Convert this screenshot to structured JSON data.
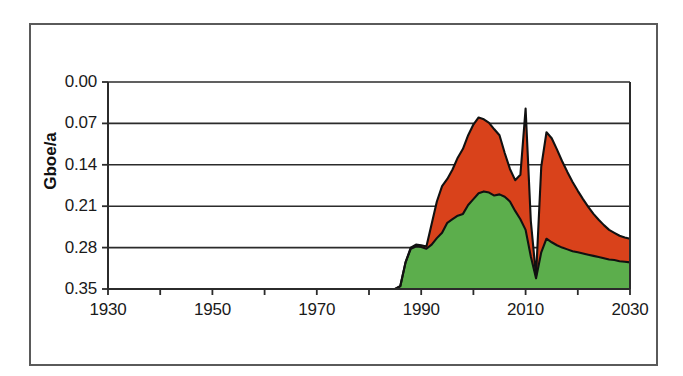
{
  "figure": {
    "background_color": "#ffffff",
    "frame_color": "#5a5a5a"
  },
  "axis_title_y": "Gboe/a",
  "y_ticks": [
    "0.35",
    "0.28",
    "0.21",
    "0.14",
    "0.07",
    "0.00"
  ],
  "x_ticks": [
    "1930",
    "1950",
    "1970",
    "1990",
    "2010",
    "2030"
  ],
  "colors": {
    "series_lower": "#5CAE4C",
    "series_upper": "#D9421B",
    "outline": "#111111",
    "gridline": "#2b2b2b",
    "text": "#1a1a1a"
  },
  "chart_data": {
    "type": "area",
    "stacked": true,
    "title": "",
    "subtitle": "",
    "xlabel": "",
    "ylabel": "Gboe/a",
    "xlim": [
      1930,
      2030
    ],
    "ylim": [
      0.0,
      0.35
    ],
    "ytick_values": [
      0.0,
      0.07,
      0.14,
      0.21,
      0.28,
      0.35
    ],
    "xtick_values": [
      1930,
      1950,
      1970,
      1990,
      2010,
      2030
    ],
    "xtick_minor_step": 10,
    "grid": true,
    "grid_axis": "y",
    "legend": false,
    "legend_position": "none",
    "annotations": [],
    "x": [
      1930,
      1935,
      1940,
      1945,
      1950,
      1955,
      1960,
      1965,
      1970,
      1975,
      1980,
      1982,
      1984,
      1985,
      1986,
      1987,
      1988,
      1989,
      1990,
      1991,
      1992,
      1993,
      1994,
      1995,
      1996,
      1997,
      1998,
      1999,
      2000,
      2001,
      2002,
      2003,
      2004,
      2005,
      2006,
      2007,
      2008,
      2009,
      2010,
      2011,
      2012,
      2013,
      2014,
      2015,
      2016,
      2017,
      2018,
      2019,
      2020,
      2021,
      2022,
      2023,
      2024,
      2025,
      2026,
      2027,
      2028,
      2029,
      2030
    ],
    "series": [
      {
        "name": "lower-green",
        "color": "#5CAE4C",
        "values": [
          0.0,
          0.0,
          0.0,
          0.0,
          0.0,
          0.0,
          0.0,
          0.0,
          0.0,
          0.0,
          0.0,
          0.0,
          0.0,
          0.0,
          0.005,
          0.045,
          0.068,
          0.072,
          0.071,
          0.068,
          0.075,
          0.086,
          0.095,
          0.112,
          0.118,
          0.124,
          0.127,
          0.142,
          0.152,
          0.162,
          0.165,
          0.163,
          0.158,
          0.16,
          0.156,
          0.148,
          0.132,
          0.118,
          0.1,
          0.055,
          0.018,
          0.062,
          0.085,
          0.079,
          0.074,
          0.07,
          0.067,
          0.064,
          0.062,
          0.06,
          0.058,
          0.056,
          0.054,
          0.052,
          0.05,
          0.049,
          0.047,
          0.046,
          0.045
        ]
      },
      {
        "name": "upper-red",
        "color": "#D9421B",
        "values": [
          0.0,
          0.0,
          0.0,
          0.0,
          0.0,
          0.0,
          0.0,
          0.0,
          0.0,
          0.0,
          0.0,
          0.0,
          0.0,
          0.0,
          0.0,
          0.0,
          0.002,
          0.003,
          0.003,
          0.004,
          0.035,
          0.062,
          0.079,
          0.074,
          0.084,
          0.098,
          0.11,
          0.118,
          0.126,
          0.128,
          0.122,
          0.118,
          0.112,
          0.1,
          0.074,
          0.055,
          0.052,
          0.075,
          0.205,
          0.06,
          0.004,
          0.145,
          0.18,
          0.176,
          0.162,
          0.146,
          0.131,
          0.117,
          0.104,
          0.092,
          0.081,
          0.071,
          0.063,
          0.056,
          0.05,
          0.046,
          0.043,
          0.041,
          0.04
        ]
      }
    ]
  }
}
